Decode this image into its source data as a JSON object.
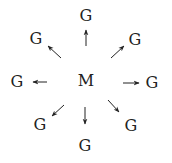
{
  "diagram": {
    "center": {
      "label": "M",
      "x": 86,
      "y": 80
    },
    "nodes": [
      {
        "label": "G",
        "x": 86,
        "y": 15
      },
      {
        "label": "G",
        "x": 36,
        "y": 38
      },
      {
        "label": "G",
        "x": 135,
        "y": 39
      },
      {
        "label": "G",
        "x": 17,
        "y": 81
      },
      {
        "label": "G",
        "x": 152,
        "y": 82
      },
      {
        "label": "G",
        "x": 40,
        "y": 124
      },
      {
        "label": "G",
        "x": 85,
        "y": 145
      },
      {
        "label": "G",
        "x": 131,
        "y": 125
      }
    ],
    "arrows": [
      {
        "direction": "up",
        "x1": 86,
        "y1": 46,
        "x2": 86,
        "y2": 30
      },
      {
        "direction": "up-left",
        "x1": 61,
        "y1": 58,
        "x2": 48,
        "y2": 46
      },
      {
        "direction": "up-right",
        "x1": 111,
        "y1": 58,
        "x2": 124,
        "y2": 46
      },
      {
        "direction": "left",
        "x1": 47,
        "y1": 82,
        "x2": 33,
        "y2": 82
      },
      {
        "direction": "right",
        "x1": 123,
        "y1": 83,
        "x2": 139,
        "y2": 83
      },
      {
        "direction": "down-left",
        "x1": 64,
        "y1": 105,
        "x2": 52,
        "y2": 116
      },
      {
        "direction": "down",
        "x1": 85,
        "y1": 107,
        "x2": 85,
        "y2": 124
      },
      {
        "direction": "down-right",
        "x1": 108,
        "y1": 100,
        "x2": 119,
        "y2": 112
      }
    ],
    "colors": {
      "ink": "#222222",
      "background": "#ffffff"
    }
  }
}
